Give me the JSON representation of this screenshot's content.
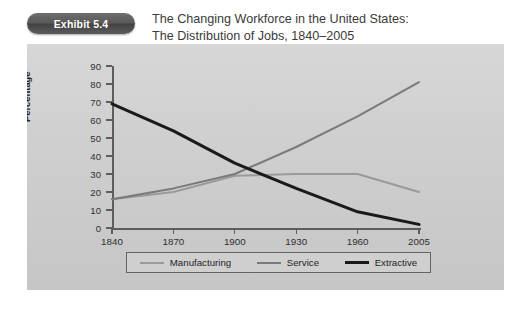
{
  "exhibit": {
    "badge_label": "Exhibit 5.4",
    "badge_color": "#4f4f4f",
    "title_line_1": "The Changing Workforce in the United States:",
    "title_line_2": "The Distribution of Jobs, 1840–2005"
  },
  "panel": {
    "background_color": "#cfcfcf",
    "axis_color": "#5d5d5d"
  },
  "chart_data": {
    "type": "line",
    "title": "The Changing Workforce in the United States: The Distribution of Jobs, 1840–2005",
    "xlabel": "",
    "ylabel": "Percentage",
    "categories": [
      "1840",
      "1870",
      "1900",
      "1930",
      "1960",
      "2005"
    ],
    "x": [
      1840,
      1870,
      1900,
      1930,
      1960,
      2005
    ],
    "ylim": [
      0,
      90
    ],
    "yticks": [
      0,
      10,
      20,
      30,
      40,
      50,
      60,
      70,
      80,
      90
    ],
    "grid": false,
    "legend_position": "bottom",
    "series": [
      {
        "name": "Manufacturing",
        "color": "#9a9a9a",
        "values": [
          16,
          20,
          29,
          30,
          30,
          20
        ]
      },
      {
        "name": "Service",
        "color": "#7a7a7a",
        "values": [
          16,
          22,
          30,
          45,
          62,
          81
        ]
      },
      {
        "name": "Extractive",
        "color": "#1a1a1a",
        "values": [
          69,
          54,
          36,
          22,
          9,
          2
        ]
      }
    ]
  },
  "legend": {
    "entries": [
      {
        "label": "Manufacturing",
        "color": "#9a9a9a"
      },
      {
        "label": "Service",
        "color": "#7a7a7a"
      },
      {
        "label": "Extractive",
        "color": "#1a1a1a"
      }
    ]
  }
}
